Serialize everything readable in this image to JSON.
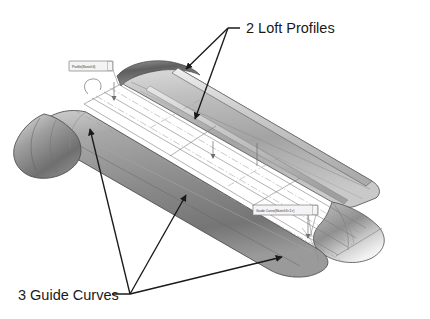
{
  "figure": {
    "type": "cad-loft-illustration",
    "background_color": "#ffffff"
  },
  "annotations": [
    {
      "id": "loft-profiles",
      "label": "2 Loft Profiles",
      "text_x": 246,
      "text_y": 33,
      "leader_start": [
        240,
        28
      ],
      "leader_elbow": [
        228,
        28
      ],
      "arrow_tips": [
        [
          181,
          72
        ],
        [
          193,
          123
        ]
      ],
      "color": "#1a1a1a"
    },
    {
      "id": "guide-curves",
      "label": "3 Guide Curves",
      "text_x": 18,
      "text_y": 300,
      "leader_start": [
        112,
        294
      ],
      "leader_elbow": [
        130,
        294
      ],
      "arrow_tips": [
        [
          87,
          124
        ],
        [
          188,
          190
        ],
        [
          287,
          254
        ]
      ],
      "color": "#1a1a1a"
    }
  ],
  "callouts": [
    {
      "id": "profile-callout",
      "text": "Profile(Sketch3)",
      "box": [
        69,
        61,
        44,
        10
      ],
      "leader_to": [
        113,
        87
      ],
      "border_color": "#808080",
      "fill_color": "#f4f4f4"
    },
    {
      "id": "guide-curve-callout",
      "text": "Guide Curve(Sketch5<1>)",
      "box": [
        253,
        205,
        65,
        10
      ],
      "leader_to": [
        308,
        237
      ],
      "border_color": "#808080",
      "fill_color": "#f4f4f4"
    }
  ],
  "geometry": {
    "surface_fill_light": "#e2e2e2",
    "surface_fill_mid": "#b4b4b4",
    "surface_fill_dark": "#6e6e6e",
    "edge_color": "#4a4a4a",
    "sketch_line_color": "#7a7a7a",
    "centerline_color": "#9a9a9a",
    "tube_count": 3,
    "profile_count": 2,
    "guide_curve_count": 3
  }
}
